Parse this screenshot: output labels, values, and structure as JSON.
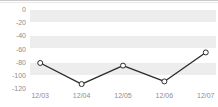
{
  "chart_data": {
    "type": "line",
    "title": "",
    "subtitle": "",
    "xlabel": "",
    "ylabel": "",
    "categories": [
      "12/03",
      "12/04",
      "12/05",
      "12/06",
      "12/07"
    ],
    "series": [
      {
        "name": "series-1",
        "values": [
          -82,
          -114,
          -86,
          -110,
          -66
        ]
      }
    ],
    "ylim": [
      -120,
      0
    ],
    "ytick_labels": [
      "0",
      "-20",
      "-40",
      "-60",
      "-80",
      "-100",
      "-120"
    ],
    "ytick_values": [
      0,
      -20,
      -40,
      -60,
      -80,
      -100,
      -120
    ],
    "grid": true,
    "legend": "none",
    "marker": "open-circle",
    "colors": {
      "line": "#2b2b2b",
      "marker_fill": "#ffffff",
      "marker_stroke": "#2b2b2b",
      "band_light": "#ffffff",
      "band_shade": "#ededed",
      "gridline": "#ffffff",
      "tick_label": "#8d8d8d",
      "top_rule": "#c9c9c9"
    }
  }
}
